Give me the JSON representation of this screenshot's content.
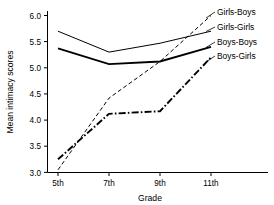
{
  "chart_data": {
    "type": "line",
    "title": "",
    "xlabel": "Grade",
    "ylabel": "Mean intimacy scores",
    "categories": [
      "5th",
      "7th",
      "9th",
      "11th"
    ],
    "x_tick_labels": [
      "5th",
      "7th",
      "9th",
      "11th"
    ],
    "y_tick_labels": [
      "3.0",
      "3.5",
      "4.0",
      "4.5",
      "5.0",
      "5.5",
      "6.0"
    ],
    "y_ticks": [
      3.0,
      3.5,
      4.0,
      4.5,
      5.0,
      5.5,
      6.0
    ],
    "ylim": [
      2.85,
      6.05
    ],
    "grid": false,
    "legend_position": "right-inline-labels",
    "series": [
      {
        "name": "Girls-Boys",
        "style": "thin-dashed",
        "values": [
          3.05,
          4.42,
          5.12,
          6.0
        ]
      },
      {
        "name": "Girls-Girls",
        "style": "thin-solid",
        "values": [
          5.7,
          5.3,
          5.47,
          5.7
        ]
      },
      {
        "name": "Boys-Boys",
        "style": "thick-solid",
        "values": [
          5.37,
          5.07,
          5.12,
          5.4
        ]
      },
      {
        "name": "Boys-Girls",
        "style": "thick-dashdot",
        "values": [
          3.25,
          4.12,
          4.17,
          5.2
        ]
      }
    ]
  },
  "legend": {
    "items": [
      {
        "label": "Girls-Boys"
      },
      {
        "label": "Girls-Girls"
      },
      {
        "label": "Boys-Boys"
      },
      {
        "label": "Boys-Girls"
      }
    ]
  },
  "axes": {
    "x_title": "Grade",
    "y_title": "Mean intimacy scores"
  }
}
